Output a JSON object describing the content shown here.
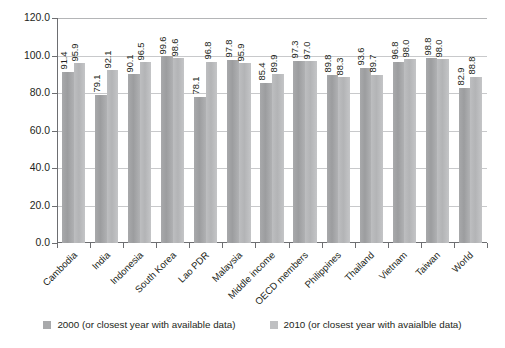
{
  "chart_data": {
    "type": "bar",
    "title": "",
    "subtitle": "",
    "xlabel": "",
    "ylabel": "",
    "ylim": [
      0,
      120
    ],
    "ytick_step": 20,
    "ytick_labels": [
      "0.0",
      "20.0",
      "40.0",
      "60.0",
      "80.0",
      "100.0",
      "120.0"
    ],
    "ytick_values": [
      0,
      20,
      40,
      60,
      80,
      100,
      120
    ],
    "grid": true,
    "legend_position": "bottom",
    "categories": [
      "Cambodia",
      "India",
      "Indonesia",
      "South Korea",
      "Lao PDR",
      "Malaysia",
      "Middle income",
      "OECD members",
      "Philippines",
      "Thailand",
      "Vietnam",
      "Taiwan",
      "World"
    ],
    "series": [
      {
        "name": "2000 (or closest year with available data)",
        "color": "#a8a9ab",
        "values": [
          91.4,
          79.1,
          90.1,
          99.6,
          78.1,
          97.8,
          85.4,
          97.3,
          89.8,
          93.6,
          96.8,
          98.8,
          82.9
        ]
      },
      {
        "name": "2010 (or closest year with avaialble data)",
        "color": "#bfc0c2",
        "values": [
          95.9,
          92.1,
          96.5,
          98.6,
          96.8,
          95.9,
          89.9,
          97.0,
          88.3,
          89.7,
          98.0,
          98.0,
          88.8
        ]
      }
    ],
    "value_labels": [
      [
        "91.4",
        "95.9"
      ],
      [
        "79.1",
        "92.1"
      ],
      [
        "90.1",
        "96.5"
      ],
      [
        "99.6",
        "98.6"
      ],
      [
        "78.1",
        "96.8"
      ],
      [
        "97.8",
        "95.9"
      ],
      [
        "85.4",
        "89.9"
      ],
      [
        "97.3",
        "97.0"
      ],
      [
        "89.8",
        "88.3"
      ],
      [
        "93.6",
        "89.7"
      ],
      [
        "96.8",
        "98.0"
      ],
      [
        "98.8",
        "98.0"
      ],
      [
        "82.9",
        "88.8"
      ]
    ]
  },
  "legend": {
    "items": [
      {
        "label": "2000 (or closest year with available data)"
      },
      {
        "label": "2010 (or closest year with avaialble data)"
      }
    ]
  }
}
